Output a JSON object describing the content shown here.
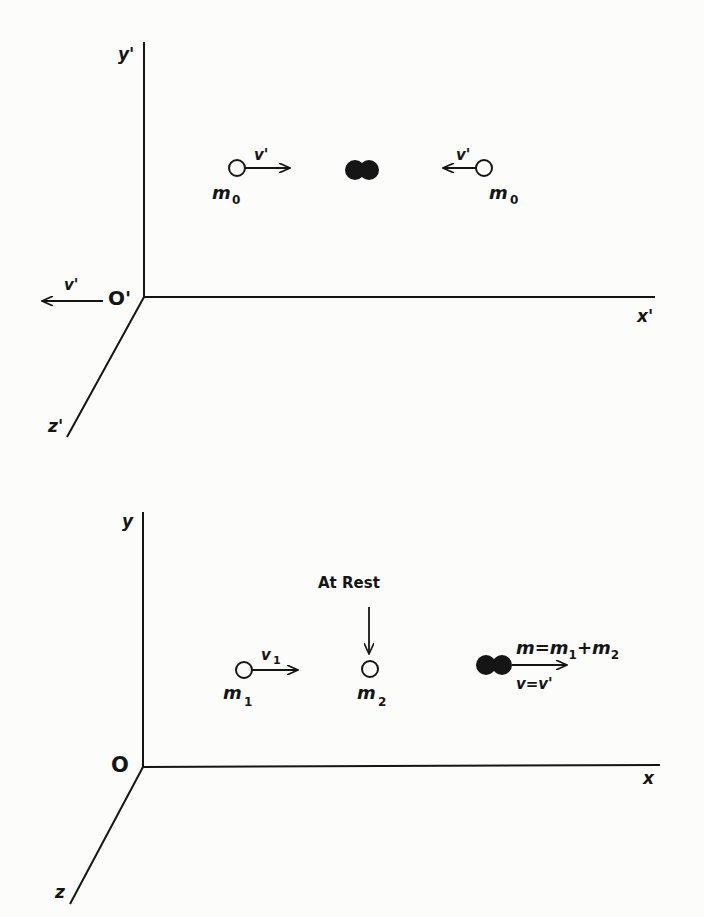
{
  "figure": {
    "top_frame": {
      "axes": {
        "y_label": "y'",
        "x_label": "x'",
        "z_label": "z'",
        "origin_label": "O'"
      },
      "frame_velocity_label": "v'",
      "particle_left": {
        "mass_label": "m",
        "mass_sub": "0",
        "velocity_label": "v'"
      },
      "particle_right": {
        "mass_label": "m",
        "mass_sub": "0",
        "velocity_label": "v'"
      },
      "combined_particle": "merged-particle"
    },
    "bottom_frame": {
      "axes": {
        "y_label": "y",
        "x_label": "x",
        "z_label": "z",
        "origin_label": "O"
      },
      "at_rest_label": "At Rest",
      "particle_1": {
        "mass_label": "m",
        "mass_sub": "1",
        "velocity_label": "v",
        "velocity_sub": "1"
      },
      "particle_2": {
        "mass_label": "m",
        "mass_sub": "2"
      },
      "combined": {
        "mass_eq_prefix": "m=m",
        "mass_eq_sub1": "1",
        "mass_eq_plus": "+m",
        "mass_eq_sub2": "2",
        "velocity_eq": "v=v'"
      }
    }
  },
  "colors": {
    "ink": "#151515",
    "paper": "#fcfcfb"
  }
}
